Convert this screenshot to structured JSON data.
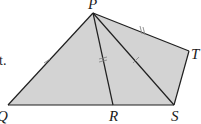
{
  "diagram": {
    "type": "geometry-figure",
    "fill_color": "#d3d3d3",
    "stroke_color": "#1f1f1f",
    "fragment_text": "t.",
    "points": {
      "P": {
        "label": "P",
        "x": 93,
        "y": 13
      },
      "T": {
        "label": "T",
        "x": 189,
        "y": 51
      },
      "S": {
        "label": "S",
        "x": 174,
        "y": 105
      },
      "R": {
        "label": "R",
        "x": 113,
        "y": 105
      },
      "Q": {
        "label": "Q",
        "x": 8,
        "y": 105
      }
    },
    "segments": [
      "PQ",
      "PR",
      "PS",
      "PT",
      "TS",
      "QS"
    ],
    "tick_marks": [
      {
        "segment": "PQ",
        "count": 1
      },
      {
        "segment": "PR",
        "count": 2
      },
      {
        "segment": "PS",
        "count": 1
      },
      {
        "segment": "PT",
        "count": 2
      }
    ]
  }
}
